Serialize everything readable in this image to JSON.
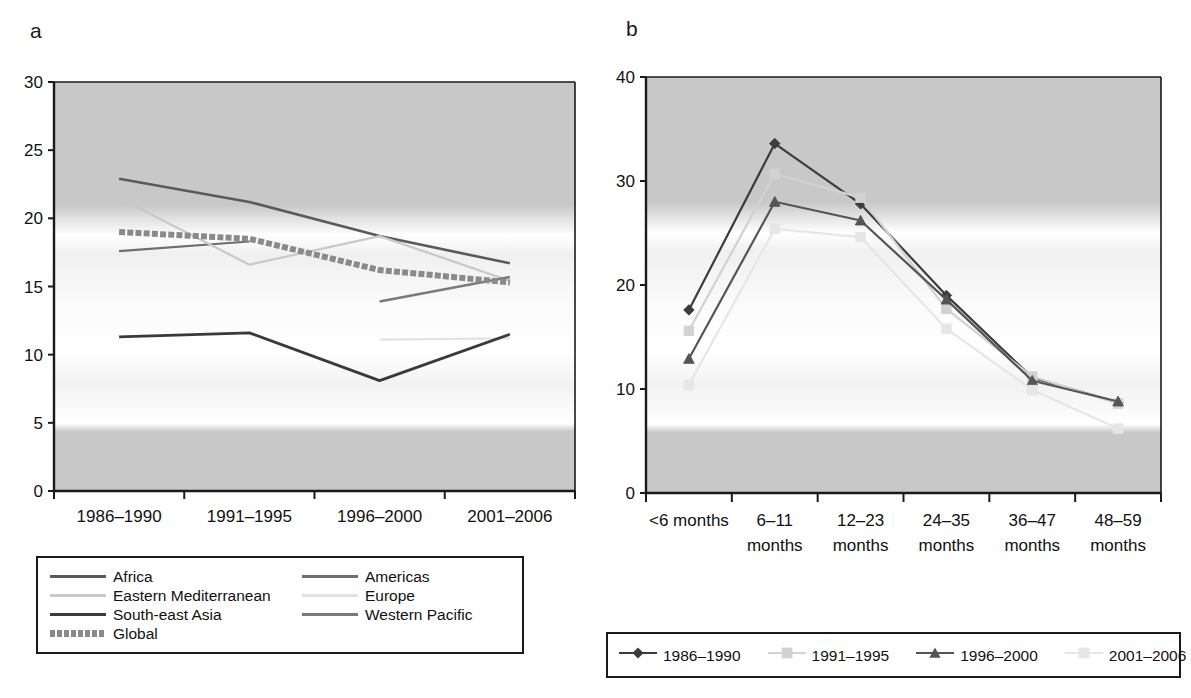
{
  "figure": {
    "panel_a_letter": "a",
    "panel_b_letter": "b"
  },
  "colors": {
    "africa": "#5a5a5a",
    "americas": "#6e6e6e",
    "eastern_mediterranean": "#c9c9c9",
    "europe": "#e2e2e2",
    "south_east_asia": "#3a3a3a",
    "western_pacific": "#7a7a7a",
    "global": "#8a8a8a",
    "series_1986": "#3c3c3c",
    "series_1991": "#d2d2d2",
    "series_1996": "#555555",
    "series_2001": "#e6e6e6",
    "axis": "#1a1a1a",
    "plot_band_dark": "#c8c8c8",
    "plot_band_light": "#ffffff"
  },
  "chart_data": [
    {
      "id": "panel-a",
      "type": "line",
      "title": "a",
      "xlabel": "",
      "ylabel": "",
      "categories": [
        "1986–1990",
        "1991–1995",
        "1996–2000",
        "2001–2006"
      ],
      "ylim": [
        0,
        30
      ],
      "yticks": [
        0,
        5,
        10,
        15,
        20,
        25,
        30
      ],
      "ytick_labels": [
        "0",
        "5",
        "10",
        "15",
        "20",
        "25",
        "30"
      ],
      "grid": false,
      "legend_position": "below",
      "series": [
        {
          "name": "Africa",
          "color_key": "africa",
          "style": "solid",
          "width": 2.6,
          "values": [
            22.9,
            21.2,
            18.7,
            16.7
          ]
        },
        {
          "name": "Americas",
          "color_key": "americas",
          "style": "solid",
          "width": 2.2,
          "values": [
            17.6,
            18.3,
            null,
            null
          ]
        },
        {
          "name": "Eastern Mediterranean",
          "color_key": "eastern_mediterranean",
          "style": "solid",
          "width": 2.2,
          "values": [
            21.5,
            16.6,
            18.7,
            15.4
          ]
        },
        {
          "name": "Europe",
          "color_key": "europe",
          "style": "solid",
          "width": 2.2,
          "values": [
            null,
            null,
            11.1,
            11.2
          ]
        },
        {
          "name": "South-east Asia",
          "color_key": "south_east_asia",
          "style": "solid",
          "width": 2.8,
          "values": [
            11.3,
            11.6,
            8.1,
            11.5
          ]
        },
        {
          "name": "Western Pacific",
          "color_key": "western_pacific",
          "style": "solid",
          "width": 2.4,
          "values": [
            null,
            null,
            13.9,
            15.7
          ]
        },
        {
          "name": "Global",
          "color_key": "global",
          "style": "thick-textured",
          "width": 5.0,
          "values": [
            19.0,
            18.5,
            16.2,
            15.3
          ]
        }
      ],
      "legend_entries": [
        {
          "label": "Africa",
          "color_key": "africa",
          "style": "solid"
        },
        {
          "label": "Americas",
          "color_key": "americas",
          "style": "solid"
        },
        {
          "label": "Eastern Mediterranean",
          "color_key": "eastern_mediterranean",
          "style": "solid"
        },
        {
          "label": "Europe",
          "color_key": "europe",
          "style": "solid"
        },
        {
          "label": "South-east Asia",
          "color_key": "south_east_asia",
          "style": "solid"
        },
        {
          "label": "Western Pacific",
          "color_key": "western_pacific",
          "style": "solid"
        },
        {
          "label": "Global",
          "color_key": "global",
          "style": "thick-textured"
        }
      ]
    },
    {
      "id": "panel-b",
      "type": "line",
      "title": "b",
      "xlabel": "",
      "ylabel": "",
      "categories": [
        "<6 months",
        "6–11 months",
        "12–23 months",
        "24–35 months",
        "36–47 months",
        "48–59 months"
      ],
      "category_lines": [
        [
          "<6 months",
          ""
        ],
        [
          "6–11",
          "months"
        ],
        [
          "12–23",
          "months"
        ],
        [
          "24–35",
          "months"
        ],
        [
          "36–47",
          "months"
        ],
        [
          "48–59",
          "months"
        ]
      ],
      "ylim": [
        0,
        40
      ],
      "yticks": [
        0,
        10,
        20,
        30,
        40
      ],
      "ytick_labels": [
        "0",
        "10",
        "20",
        "30",
        "40"
      ],
      "grid": false,
      "legend_position": "below",
      "series": [
        {
          "name": "1986–1990",
          "color_key": "series_1986",
          "marker": "diamond",
          "values": [
            17.6,
            33.6,
            27.8,
            19.0,
            11.1,
            8.7
          ]
        },
        {
          "name": "1991–1995",
          "color_key": "series_1991",
          "marker": "square",
          "values": [
            15.6,
            30.7,
            28.4,
            17.7,
            11.2,
            8.6
          ]
        },
        {
          "name": "1996–2000",
          "color_key": "series_1996",
          "marker": "triangle",
          "values": [
            12.9,
            28.0,
            26.2,
            18.6,
            10.8,
            8.8
          ]
        },
        {
          "name": "2001–2006",
          "color_key": "series_2001",
          "marker": "square",
          "values": [
            10.4,
            25.4,
            24.6,
            15.8,
            9.9,
            6.2
          ]
        }
      ],
      "legend_entries": [
        {
          "label": "1986–1990",
          "color_key": "series_1986",
          "marker": "diamond"
        },
        {
          "label": "1991–1995",
          "color_key": "series_1991",
          "marker": "square"
        },
        {
          "label": "1996–2000",
          "color_key": "series_1996",
          "marker": "triangle"
        },
        {
          "label": "2001–2006",
          "color_key": "series_2001",
          "marker": "square"
        }
      ]
    }
  ]
}
